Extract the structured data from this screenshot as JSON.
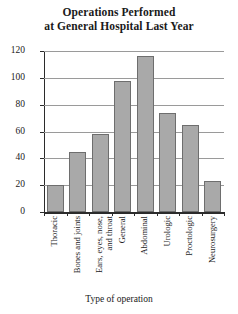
{
  "chart_data": {
    "type": "bar",
    "title": "Operations Performed at General Hospital Last Year",
    "title_lines": [
      "Operations Performed",
      "at General Hospital Last Year"
    ],
    "xlabel": "Type of operation",
    "ylabel": "Number of cases",
    "categories": [
      "Thoracic",
      "Bones and joints",
      "Ears, eyes, nose, and throat",
      "General",
      "Abdominal",
      "Urologic",
      "Proctologic",
      "Neurosurgery"
    ],
    "category_lines": [
      [
        "Thoracic"
      ],
      [
        "Bones and joints"
      ],
      [
        "Ears, eyes, nose,",
        "and throat"
      ],
      [
        "General"
      ],
      [
        "Abdominal"
      ],
      [
        "Urologic"
      ],
      [
        "Proctologic"
      ],
      [
        "Neurosurgery"
      ]
    ],
    "values": [
      20,
      45,
      58,
      98,
      116,
      74,
      65,
      23
    ],
    "ylim": [
      0,
      120
    ],
    "yticks": [
      0,
      20,
      40,
      60,
      80,
      100,
      120
    ],
    "ytick_labels": [
      "0",
      "20",
      "40",
      "60",
      "80",
      "100",
      "120"
    ],
    "grid": true,
    "legend": "none",
    "bar_color": "#a9a9a9",
    "bar_border_color": "#6e6e6e",
    "axis_color": "#2b2b2b",
    "grid_color": "#9a9a9a",
    "background": "#ffffff"
  }
}
